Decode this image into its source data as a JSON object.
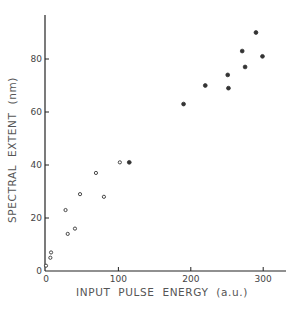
{
  "chart_data": {
    "type": "scatter",
    "title": "",
    "xlabel": "INPUT PULSE ENERGY (a.u.)",
    "ylabel": "SPECTRAL EXTENT (nm)",
    "xlim": [
      0,
      330
    ],
    "ylim": [
      0,
      97
    ],
    "x_ticks": [
      0,
      100,
      200,
      300
    ],
    "y_ticks": [
      0,
      20,
      40,
      60,
      80
    ],
    "x_tick_labels": [
      "0",
      "100",
      "200",
      "300"
    ],
    "y_tick_labels": [
      "0",
      "20",
      "40",
      "60",
      "80"
    ],
    "grid": false,
    "legend": null,
    "series": [
      {
        "name": "open markers",
        "marker": "open-circle",
        "points": [
          [
            0,
            2
          ],
          [
            6,
            5
          ],
          [
            7,
            7
          ],
          [
            27,
            23
          ],
          [
            30,
            14
          ],
          [
            40,
            16
          ],
          [
            47,
            29
          ],
          [
            69,
            37
          ],
          [
            80,
            28
          ],
          [
            102,
            41
          ]
        ]
      },
      {
        "name": "filled markers",
        "marker": "filled-circle",
        "points": [
          [
            115,
            41
          ],
          [
            190,
            63
          ],
          [
            220,
            70
          ],
          [
            251,
            74
          ],
          [
            252,
            69
          ],
          [
            271,
            83
          ],
          [
            275,
            77
          ],
          [
            290,
            90
          ],
          [
            299,
            81
          ]
        ]
      }
    ]
  },
  "axes": {
    "x_label": "INPUT  PULSE  ENERGY  (a.u.)",
    "y_label": "SPECTRAL  EXTENT  (nm)"
  }
}
